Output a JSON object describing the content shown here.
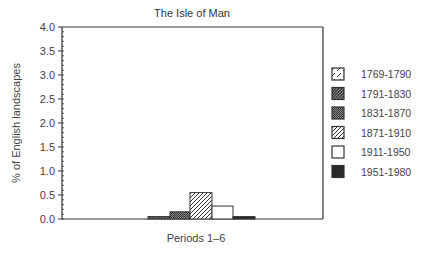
{
  "chart_data": {
    "type": "bar",
    "title": "The Isle of Man",
    "xlabel": "Periods 1–6",
    "ylabel": "% of English landscapes",
    "ylim": [
      0,
      4.0
    ],
    "yticks": [
      "0.0",
      "0.5",
      "1.0",
      "1.5",
      "2.0",
      "2.5",
      "3.0",
      "3.5",
      "4.0"
    ],
    "grid": false,
    "legend_position": "right",
    "categories": [
      "1769-1790",
      "1791-1830",
      "1831-1870",
      "1871-1910",
      "1911-1950",
      "1951-1980"
    ],
    "series": [
      {
        "name": "1769-1790",
        "pattern": "sparse-dot",
        "value": 0.0
      },
      {
        "name": "1791-1830",
        "pattern": "dark-hatch",
        "value": 0.05
      },
      {
        "name": "1831-1870",
        "pattern": "stipple",
        "value": 0.15
      },
      {
        "name": "1871-1910",
        "pattern": "diagonal-hatch",
        "value": 0.55
      },
      {
        "name": "1911-1950",
        "pattern": "white",
        "value": 0.27
      },
      {
        "name": "1951-1980",
        "pattern": "solid-dark",
        "value": 0.05
      }
    ],
    "values": [
      0.0,
      0.05,
      0.15,
      0.55,
      0.27,
      0.05
    ]
  }
}
